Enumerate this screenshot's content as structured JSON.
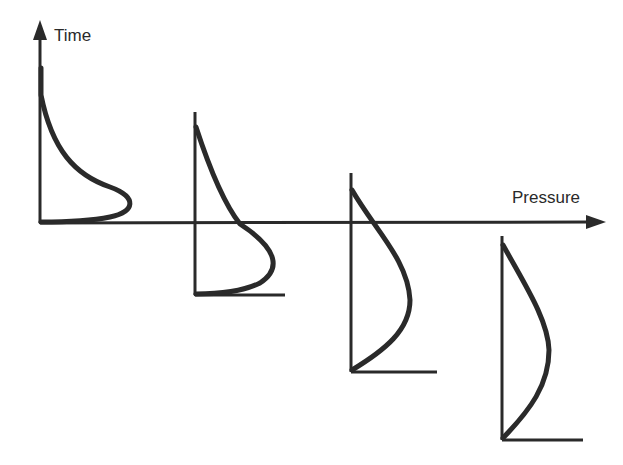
{
  "diagram": {
    "axes": {
      "time_label": "Time",
      "pressure_label": "Pressure"
    },
    "colors": {
      "ink": "#2a2a2a",
      "background": "#ffffff"
    },
    "profiles": [
      {
        "index": 1,
        "shape": "skewed-near-base"
      },
      {
        "index": 2,
        "shape": "skewed-lower"
      },
      {
        "index": 3,
        "shape": "near-parabolic"
      },
      {
        "index": 4,
        "shape": "parabolic"
      }
    ]
  }
}
